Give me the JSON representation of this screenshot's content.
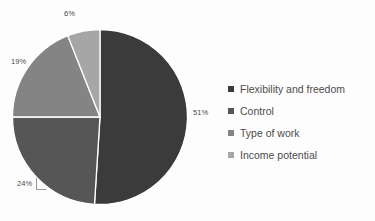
{
  "chart_data": {
    "type": "pie",
    "title": "",
    "xlabel": "",
    "ylabel": "",
    "categories": [
      "Flexibility and freedom",
      "Control",
      "Type of work",
      "Income potential"
    ],
    "values": [
      51,
      24,
      19,
      6
    ],
    "value_labels": [
      "51%",
      "24%",
      "19%",
      "6%"
    ],
    "colors": [
      "#3b3b3b",
      "#565656",
      "#848484",
      "#a6a6a6"
    ],
    "legend_position": "right",
    "grid": false,
    "start_angle_deg": 0,
    "direction": "clockwise",
    "slice_border_color": "#ffffff"
  },
  "labels": {
    "flexibility_pct": "51%",
    "control_pct": "24%",
    "type_of_work_pct": "19%",
    "income_potential_pct": "6%"
  },
  "legend": {
    "items": [
      {
        "label": "Flexibility and freedom",
        "color": "#3b3b3b"
      },
      {
        "label": "Control",
        "color": "#565656"
      },
      {
        "label": "Type of work",
        "color": "#848484"
      },
      {
        "label": "Income potential",
        "color": "#a6a6a6"
      }
    ]
  },
  "background": "#fdfdfd"
}
